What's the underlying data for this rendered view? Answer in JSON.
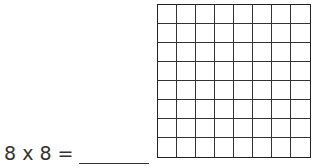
{
  "equation": {
    "text": "8 x 8 =",
    "answer": ""
  },
  "grid": {
    "rows": 8,
    "cols": 8
  }
}
